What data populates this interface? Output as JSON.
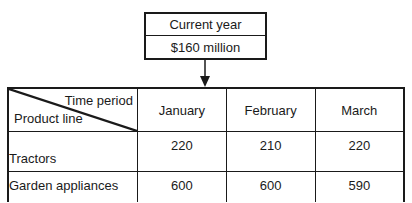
{
  "summary_box": {
    "label": "Current year",
    "value": "$160 million"
  },
  "table": {
    "corner": {
      "column_header": "Time period",
      "row_header": "Product line"
    },
    "columns": [
      "January",
      "February",
      "March"
    ],
    "rows": [
      {
        "label": "Tractors",
        "values": [
          "220",
          "210",
          "220"
        ]
      },
      {
        "label": "Garden appliances",
        "values": [
          "600",
          "600",
          "590"
        ]
      }
    ]
  },
  "colors": {
    "line": "#1a1a1a",
    "background": "#ffffff"
  }
}
